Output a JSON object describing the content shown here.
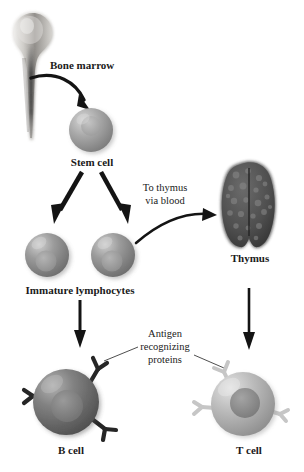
{
  "figure": {
    "background_color": "#ffffff",
    "ink_color": "#1a1a1a"
  },
  "labels": {
    "bone_marrow": "Bone marrow",
    "stem_cell": "Stem cell",
    "to_thymus_line1": "To thymus",
    "to_thymus_line2": "via blood",
    "thymus": "Thymus",
    "immature_lymphocytes": "Immature lymphocytes",
    "antigen_line1": "Antigen",
    "antigen_line2": "recognizing",
    "antigen_line3": "proteins",
    "b_cell": "B cell",
    "t_cell": "T cell"
  },
  "structures": {
    "bone": {
      "name": "long-bone-femur",
      "fill_light": "#d8d6d3",
      "fill_mid": "#a8a5a1",
      "marrow_dark": "#3b3b3b"
    },
    "stem_cell": {
      "name": "stem-cell",
      "body_color": "#9c9c9c",
      "highlight": "#cfcfcf",
      "nucleus_color": "#b0b0b0"
    },
    "immature_lymphocytes": {
      "count": 2,
      "body_color": "#8f8f8f",
      "highlight": "#c6c6c6",
      "nucleus_color": "#9a9a9a"
    },
    "thymus": {
      "name": "thymus-organ",
      "fill": "#4a4a4a",
      "speckle": "#6e6e6e",
      "lobes": 2
    },
    "b_cell": {
      "name": "b-cell",
      "body_color": "#6f6f6f",
      "highlight": "#a9a9a9",
      "nucleus_color": "#7d7d7d",
      "receptor_color": "#2b2b2b",
      "receptor_count": 3
    },
    "t_cell": {
      "name": "t-cell",
      "body_color": "#b4b4b4",
      "highlight": "#dcdcdc",
      "nucleus_color": "#8a8a8a",
      "receptor_color": "#c2c2c2",
      "receptor_count": 3
    }
  },
  "arrows": [
    {
      "name": "arrow-marrow-to-stem-cell",
      "style": "curved-thick"
    },
    {
      "name": "arrow-stem-to-lymphocyte-left",
      "style": "straight-thick"
    },
    {
      "name": "arrow-stem-to-lymphocyte-right",
      "style": "straight-thick"
    },
    {
      "name": "arrow-lymphocyte-to-thymus",
      "style": "curved-thin"
    },
    {
      "name": "arrow-lymphocyte-to-b-cell",
      "style": "straight-thin"
    },
    {
      "name": "arrow-thymus-to-t-cell",
      "style": "straight-thin"
    }
  ],
  "leader_lines": [
    {
      "name": "leader-antigen-to-b-cell"
    },
    {
      "name": "leader-antigen-to-t-cell"
    }
  ],
  "font_sizes": {
    "label_main": "11px",
    "label_small": "10.5px"
  }
}
